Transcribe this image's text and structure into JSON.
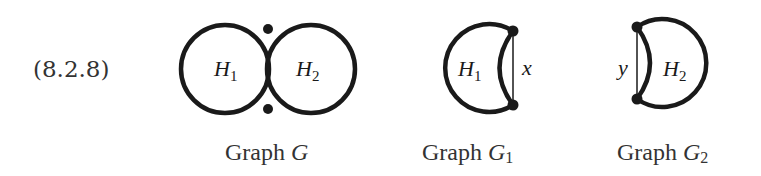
{
  "equation_number": "(8.2.8)",
  "figures": [
    {
      "caption_prefix": "Graph ",
      "caption_var": "G",
      "caption_sub": "",
      "regions": [
        {
          "label": "H",
          "sub": "1"
        },
        {
          "label": "H",
          "sub": "2"
        }
      ]
    },
    {
      "caption_prefix": "Graph ",
      "caption_var": "G",
      "caption_sub": "1",
      "regions": [
        {
          "label": "H",
          "sub": "1"
        }
      ],
      "edge_label": "x"
    },
    {
      "caption_prefix": "Graph ",
      "caption_var": "G",
      "caption_sub": "2",
      "regions": [
        {
          "label": "H",
          "sub": "2"
        }
      ],
      "edge_label": "y"
    }
  ],
  "colors": {
    "stroke": "#1a1a1a",
    "background": "#ffffff"
  }
}
